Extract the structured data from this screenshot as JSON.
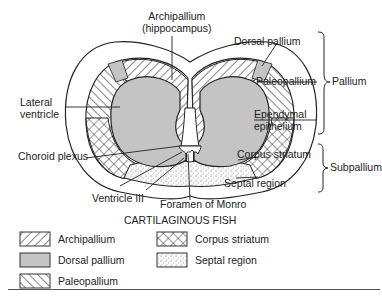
{
  "diagram": {
    "caption": "CARTILAGINOUS FISH",
    "labels": {
      "archipallium": "Archipallium\n(hippocampus)",
      "archipallium_line1": "Archipallium",
      "archipallium_line2": "(hippocampus)",
      "dorsal_pallium": "Dorsal pallium",
      "paleopallium": "Paleopallium",
      "lateral_ventricle_line1": "Lateral",
      "lateral_ventricle_line2": "ventricle",
      "ependymal_line1": "Ependymal",
      "ependymal_line2": "epithelium",
      "choroid_plexus": "Choroid plexus",
      "corpus_striatum": "Corpus striatum",
      "septal_region": "Septal region",
      "ventricle_iii": "Ventricle III",
      "foramen_of_monro": "Foramen of Monro"
    },
    "groups": {
      "pallium": "Pallium",
      "subpallium": "Subpallium"
    }
  },
  "legend": {
    "items": [
      {
        "label": "Archipallium",
        "pattern": "back-diagonal-hatch"
      },
      {
        "label": "Dorsal pallium",
        "pattern": "gray-fill"
      },
      {
        "label": "Paleopallium",
        "pattern": "forward-diagonal-hatch"
      },
      {
        "label": "Corpus striatum",
        "pattern": "crosshatch"
      },
      {
        "label": "Septal region",
        "pattern": "stipple"
      }
    ]
  },
  "colors": {
    "gray_fill": "#c4c4c4",
    "line": "#222222"
  }
}
